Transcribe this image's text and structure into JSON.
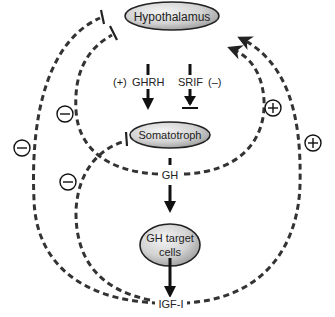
{
  "nodes": {
    "hypothalamus": "Hypothalamus",
    "somatotroph": "Somatotroph",
    "gh_target_line1": "GH target",
    "gh_target_line2": "cells"
  },
  "hormones": {
    "ghrh": "GHRH",
    "srif": "SRIF",
    "gh": "GH",
    "igf1": "IGF-I"
  },
  "signs": {
    "ghrh_effect": "(+)",
    "srif_effect": "(–)",
    "negative": "−",
    "positive": "+"
  },
  "feedback_loops": [
    {
      "from": "IGF-I",
      "to": "Hypothalamus",
      "effect": "−"
    },
    {
      "from": "GH",
      "to": "Hypothalamus",
      "effect": "−"
    },
    {
      "from": "IGF-I",
      "to": "Somatotroph",
      "effect": "−"
    },
    {
      "from": "GH",
      "to": "Hypothalamus",
      "effect": "+"
    },
    {
      "from": "IGF-I",
      "to": "Hypothalamus",
      "effect": "+"
    }
  ],
  "colors": {
    "node_fill_light": "#f2f2f2",
    "node_fill_dark": "#a8a8a8",
    "stroke": "#222222",
    "dash": "#333333"
  }
}
